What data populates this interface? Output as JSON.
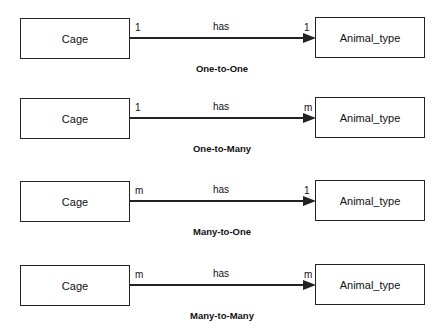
{
  "diagram": {
    "relationships": [
      {
        "left_entity": "Cage",
        "right_entity": "Animal_type",
        "verb": "has",
        "left_cardinality": "1",
        "right_cardinality": "1",
        "caption": "One-to-One"
      },
      {
        "left_entity": "Cage",
        "right_entity": "Animal_type",
        "verb": "has",
        "left_cardinality": "1",
        "right_cardinality": "m",
        "caption": "One-to-Many"
      },
      {
        "left_entity": "Cage",
        "right_entity": "Animal_type",
        "verb": "has",
        "left_cardinality": "m",
        "right_cardinality": "1",
        "caption": "Many-to-One"
      },
      {
        "left_entity": "Cage",
        "right_entity": "Animal_type",
        "verb": "has",
        "left_cardinality": "m",
        "right_cardinality": "m",
        "caption": "Many-to-Many"
      }
    ]
  }
}
